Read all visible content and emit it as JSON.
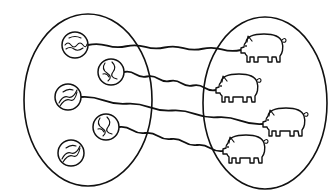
{
  "diagram": {
    "type": "set-correspondence",
    "colors": {
      "ink": "#111111",
      "background": "#ffffff"
    },
    "sets": [
      {
        "id": "marbles",
        "label": "",
        "count": 5,
        "ellipse": {
          "cx": 88,
          "cy": 100,
          "rx": 64,
          "ry": 86
        }
      },
      {
        "id": "pigs",
        "label": "",
        "count": 4,
        "ellipse": {
          "cx": 265,
          "cy": 103,
          "rx": 62,
          "ry": 86
        }
      }
    ],
    "marbles": [
      {
        "id": "m1",
        "cx": 75,
        "cy": 45,
        "r": 13,
        "pattern": "wave"
      },
      {
        "id": "m2",
        "cx": 111,
        "cy": 72,
        "r": 13,
        "pattern": "swirl"
      },
      {
        "id": "m3",
        "cx": 68,
        "cy": 97,
        "r": 13,
        "pattern": "stripes"
      },
      {
        "id": "m4",
        "cx": 106,
        "cy": 127,
        "r": 13,
        "pattern": "swirl"
      },
      {
        "id": "m5",
        "cx": 71,
        "cy": 153,
        "r": 13,
        "pattern": "stripes"
      }
    ],
    "pigs": [
      {
        "id": "p1",
        "x": 240,
        "y": 32
      },
      {
        "id": "p2",
        "x": 215,
        "y": 72
      },
      {
        "id": "p3",
        "x": 262,
        "y": 106
      },
      {
        "id": "p4",
        "x": 222,
        "y": 133
      }
    ],
    "connections": [
      {
        "from": "m1",
        "to": "p1"
      },
      {
        "from": "m2",
        "to": "p2"
      },
      {
        "from": "m3",
        "to": "p3"
      },
      {
        "from": "m4",
        "to": "p4"
      }
    ],
    "unmatched": [
      "m5"
    ]
  }
}
